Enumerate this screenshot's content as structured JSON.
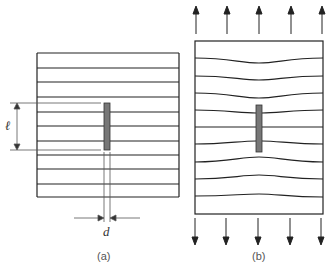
{
  "panels": [
    {
      "id": "a",
      "caption": "(a)",
      "description": "Plate with crack of length l and width d, parallel load lines"
    },
    {
      "id": "b",
      "caption": "(b)",
      "description": "Plate under tension with stress lines diverted around crack"
    }
  ],
  "symbols": {
    "length": "ℓ",
    "width": "d"
  },
  "colors": {
    "line": "#222222",
    "crack": "#777777",
    "dim": "#555555"
  }
}
